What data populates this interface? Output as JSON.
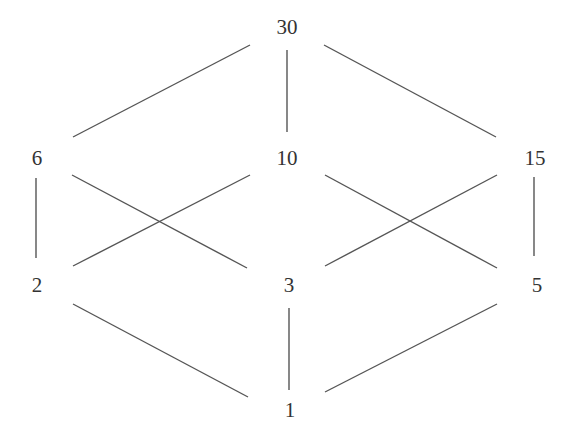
{
  "colors": {
    "line": "#555555",
    "text": "#333333",
    "background": "#ffffff"
  },
  "nodes": [
    {
      "id": "30",
      "label": "30",
      "x": 287,
      "y": 27
    },
    {
      "id": "6",
      "label": "6",
      "x": 37,
      "y": 158
    },
    {
      "id": "10",
      "label": "10",
      "x": 287,
      "y": 158
    },
    {
      "id": "15",
      "label": "15",
      "x": 535,
      "y": 158
    },
    {
      "id": "2",
      "label": "2",
      "x": 37,
      "y": 285
    },
    {
      "id": "3",
      "label": "3",
      "x": 289,
      "y": 285
    },
    {
      "id": "5",
      "label": "5",
      "x": 537,
      "y": 285
    },
    {
      "id": "1",
      "label": "1",
      "x": 290,
      "y": 410
    }
  ],
  "edges": [
    {
      "from": "30",
      "to": "6",
      "x1": 250,
      "y1": 45,
      "x2": 73,
      "y2": 137
    },
    {
      "from": "30",
      "to": "10",
      "x1": 287,
      "y1": 50,
      "x2": 287,
      "y2": 132
    },
    {
      "from": "30",
      "to": "15",
      "x1": 324,
      "y1": 45,
      "x2": 496,
      "y2": 137
    },
    {
      "from": "6",
      "to": "2",
      "x1": 36,
      "y1": 178,
      "x2": 36,
      "y2": 258
    },
    {
      "from": "6",
      "to": "3",
      "x1": 72,
      "y1": 175,
      "x2": 247,
      "y2": 268
    },
    {
      "from": "10",
      "to": "2",
      "x1": 250,
      "y1": 175,
      "x2": 73,
      "y2": 266
    },
    {
      "from": "10",
      "to": "5",
      "x1": 325,
      "y1": 175,
      "x2": 497,
      "y2": 268
    },
    {
      "from": "15",
      "to": "3",
      "x1": 497,
      "y1": 175,
      "x2": 325,
      "y2": 266
    },
    {
      "from": "15",
      "to": "5",
      "x1": 534,
      "y1": 177,
      "x2": 534,
      "y2": 256
    },
    {
      "from": "2",
      "to": "1",
      "x1": 73,
      "y1": 304,
      "x2": 248,
      "y2": 397
    },
    {
      "from": "3",
      "to": "1",
      "x1": 289,
      "y1": 308,
      "x2": 289,
      "y2": 390
    },
    {
      "from": "5",
      "to": "1",
      "x1": 497,
      "y1": 304,
      "x2": 325,
      "y2": 392
    }
  ]
}
